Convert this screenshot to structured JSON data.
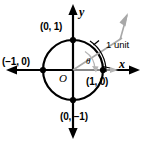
{
  "figure": {
    "width": 145,
    "height": 143,
    "background": "#ffffff"
  },
  "colors": {
    "axis": "#000000",
    "circle": "#000000",
    "ray": "#a8a8a8",
    "angle_arc": "#b5b5b5",
    "arc_marker": "#000000",
    "point": "#000000",
    "label": "#000000"
  },
  "geometry": {
    "center_x": 73,
    "center_y": 70,
    "radius": 30,
    "ray_angle_degrees": 57
  },
  "labels": {
    "point_top": "(0, 1)",
    "point_left": "(−1, 0)",
    "point_right": "(1, 0)",
    "point_bottom": "(0, −1)",
    "origin": "O",
    "x_axis": "x",
    "y_axis": "y",
    "theta": "θ",
    "arc_length": "1 unit"
  },
  "points": [
    {
      "name": "top",
      "label": "(0, 1)",
      "x": 0,
      "y": 1
    },
    {
      "name": "left",
      "label": "(−1, 0)",
      "x": -1,
      "y": 0
    },
    {
      "name": "right",
      "label": "(1, 0)",
      "x": 1,
      "y": 0
    },
    {
      "name": "bottom",
      "label": "(0, −1)",
      "x": 0,
      "y": -1
    }
  ],
  "annotations": {
    "angle_symbol": "θ",
    "arc_measure": "1 unit",
    "description": "Unit circle centered at origin O with radius 1; a gray ray from the origin makes angle theta with the positive x-axis, subtending an arc of 1 unit."
  }
}
